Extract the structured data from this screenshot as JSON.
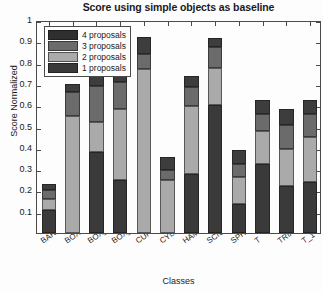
{
  "chart_data": {
    "type": "bar",
    "stacked": true,
    "title": "Score using simple objects as baseline",
    "xlabel": "Classes",
    "ylabel": "Score Normalized",
    "ylim": [
      0,
      1
    ],
    "yticks": [
      0.1,
      0.2,
      0.3,
      0.4,
      0.5,
      0.6,
      0.7,
      0.8,
      0.9,
      1
    ],
    "ytick_labels": [
      "0.1",
      "0.2",
      "0.3",
      "0.4",
      "0.5",
      "0.6",
      "0.7",
      "0.8",
      "0.9",
      "1"
    ],
    "grid": false,
    "legend_position": "upper left",
    "categories": [
      "BAR",
      "BOX",
      "BOX_1",
      "BOX_2",
      "CUP",
      "CYLINDER",
      "HAMMER",
      "SCISSOR",
      "SPHERE",
      "T",
      "TRIANGLE",
      "T_1"
    ],
    "series": [
      {
        "name": "1 proposals",
        "color": "#3a3a3a",
        "values": [
          0.11,
          0.0,
          0.38,
          0.25,
          0.0,
          0.0,
          0.275,
          0.6,
          0.135,
          0.325,
          0.22,
          0.24
        ]
      },
      {
        "name": "2 proposals",
        "color": "#aaaaaa",
        "values": [
          0.05,
          0.55,
          0.14,
          0.33,
          0.77,
          0.25,
          0.32,
          0.175,
          0.13,
          0.155,
          0.175,
          0.21
        ]
      },
      {
        "name": "3 proposals",
        "color": "#6b6b6b",
        "values": [
          0.04,
          0.11,
          0.17,
          0.13,
          0.07,
          0.045,
          0.09,
          0.1,
          0.06,
          0.08,
          0.11,
          0.11
        ]
      },
      {
        "name": "4 proposals",
        "color": "#3d3d3d",
        "values": [
          0.03,
          0.04,
          0.07,
          0.05,
          0.08,
          0.06,
          0.05,
          0.04,
          0.065,
          0.065,
          0.075,
          0.065
        ]
      }
    ],
    "totals": [
      0.23,
      0.7,
      0.76,
      0.76,
      0.92,
      0.355,
      0.735,
      0.915,
      0.39,
      0.625,
      0.58,
      0.625
    ]
  },
  "legend": {
    "entries": [
      {
        "label": "4 proposals",
        "color": "#2f2f2f"
      },
      {
        "label": "3 proposals",
        "color": "#6b6b6b"
      },
      {
        "label": "2 proposals",
        "color": "#aaaaaa"
      },
      {
        "label": "1 proposals",
        "color": "#3a3a3a"
      }
    ]
  },
  "colors": {
    "axis": "#4a4a4a",
    "text": "#1a1a1a",
    "background": "#fdfdfd"
  }
}
